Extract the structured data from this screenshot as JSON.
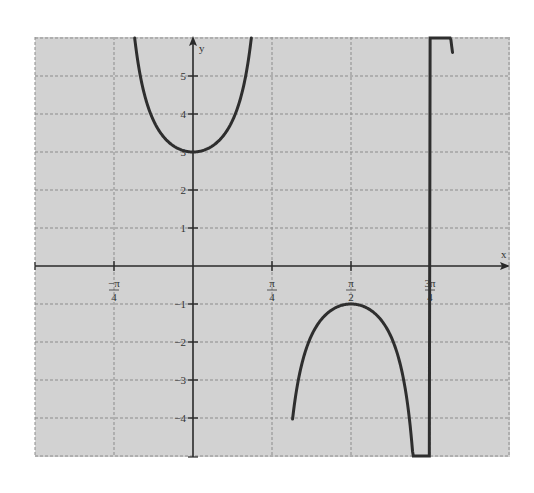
{
  "chart_data": {
    "type": "line",
    "title": "",
    "function": "y = 2 sec(2x) + 1",
    "xlabel": "x",
    "ylabel": "y",
    "xlim": [
      -1.5708,
      3.1416
    ],
    "ylim": [
      -5,
      6
    ],
    "grid": true,
    "x_ticks": [
      {
        "value": -0.7854,
        "label_num": "−π",
        "label_den": "4"
      },
      {
        "value": 0.7854,
        "label_num": "π",
        "label_den": "4"
      },
      {
        "value": 1.5708,
        "label_num": "π",
        "label_den": "2"
      },
      {
        "value": 2.3562,
        "label_num": "3π",
        "label_den": "4"
      }
    ],
    "y_ticks": [
      {
        "value": 5,
        "label": "5"
      },
      {
        "value": 4,
        "label": "4"
      },
      {
        "value": 3,
        "label": "3"
      },
      {
        "value": 2,
        "label": "2"
      },
      {
        "value": 1,
        "label": "1"
      },
      {
        "value": -1,
        "label": "−1"
      },
      {
        "value": -2,
        "label": "−2"
      },
      {
        "value": -3,
        "label": "−3"
      },
      {
        "value": -4,
        "label": "−4"
      }
    ],
    "series": [
      {
        "name": "upper branch",
        "x_range": [
          -0.58,
          0.58
        ],
        "key_points": [
          {
            "x": -0.58,
            "y": 6
          },
          {
            "x": -0.4,
            "y": 3.87
          },
          {
            "x": 0,
            "y": 3
          },
          {
            "x": 0.4,
            "y": 3.87
          },
          {
            "x": 0.58,
            "y": 6
          }
        ]
      },
      {
        "name": "lower branch",
        "x_range": [
          0.99,
          2.58
        ],
        "key_points": [
          {
            "x": 0.99,
            "y": -4.8
          },
          {
            "x": 1.2,
            "y": -1.72
          },
          {
            "x": 1.5708,
            "y": -1
          },
          {
            "x": 1.95,
            "y": -1.72
          },
          {
            "x": 2.58,
            "y": -5
          }
        ]
      }
    ],
    "asymptotes": [
      -0.7854,
      0.7854,
      2.3562
    ],
    "colors": {
      "background": "#d2d2d2",
      "grid": "#8c8c8c",
      "axis": "#2a2a2a",
      "curve": "#2e2e2e"
    }
  }
}
